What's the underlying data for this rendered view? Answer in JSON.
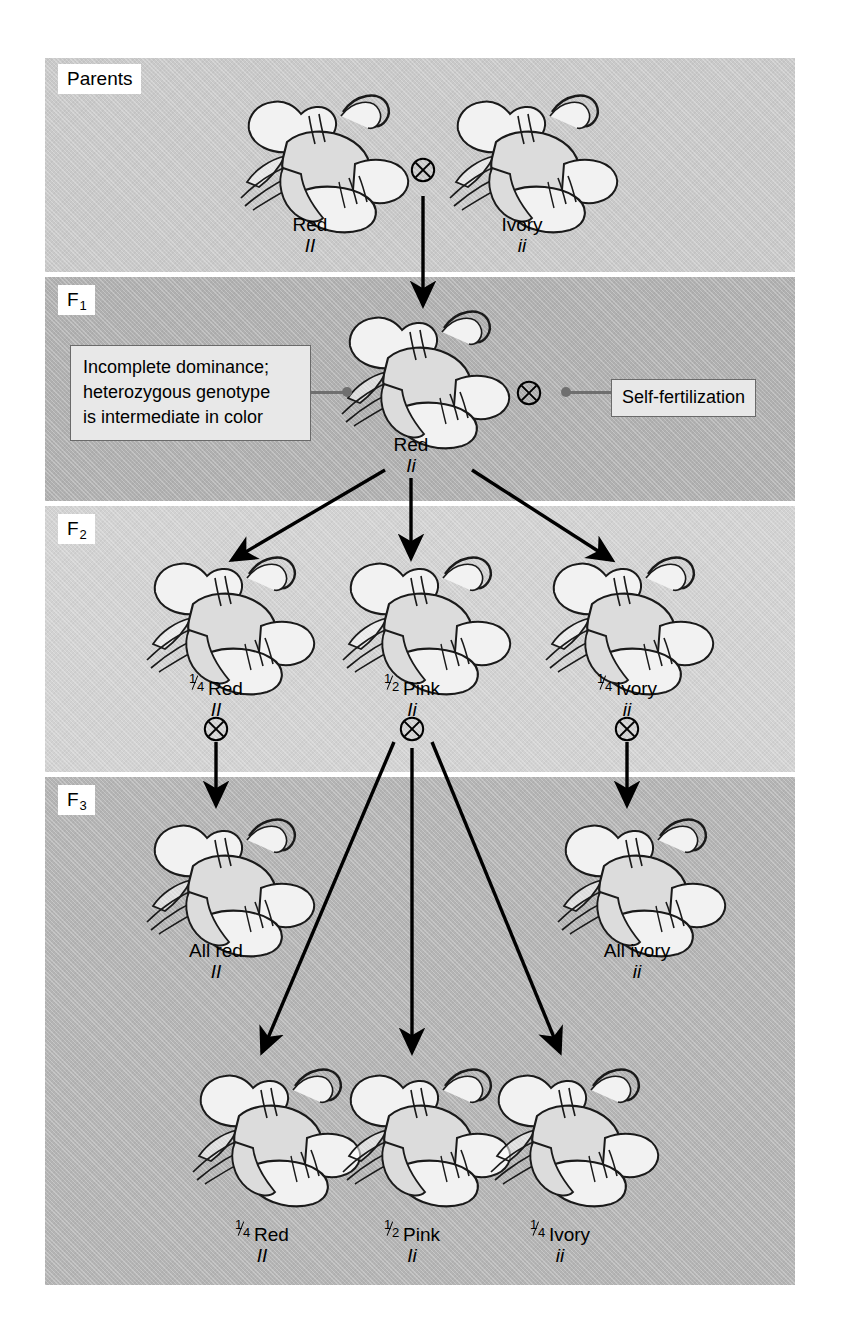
{
  "figure": {
    "background_color": "#ffffff"
  },
  "palette": {
    "band_parents": "#c9c9c9",
    "band_f1": "#b0b0b0",
    "band_f2": "#d2d2d2",
    "band_f3": "#b4b4b4",
    "flower_red": "#757575",
    "flower_pink": "#b3b3b3",
    "flower_ivory": "#f2f2f2",
    "outline": "#1a1a1a",
    "callout_fill": "#e8e8e8",
    "callout_border": "#6a6a6a",
    "leader_line": "#6f6f6f"
  },
  "generations": [
    {
      "id": "parents",
      "label": "Parents",
      "label_sub": ""
    },
    {
      "id": "f1",
      "label": "F",
      "label_sub": "1"
    },
    {
      "id": "f2",
      "label": "F",
      "label_sub": "2"
    },
    {
      "id": "f3",
      "label": "F",
      "label_sub": "3"
    }
  ],
  "parents": {
    "left": {
      "phenotype": "Red",
      "genotype": "II",
      "color": "red"
    },
    "right": {
      "phenotype": "Ivory",
      "genotype": "ii",
      "color": "ivory"
    },
    "cross_symbol": "circled-times"
  },
  "f1": {
    "offspring": {
      "phenotype": "Red",
      "genotype": "Ii",
      "color": "red"
    },
    "cross_symbol": "circled-times",
    "callout_left": "Incomplete dominance; heterozygous genotype is intermediate in color",
    "callout_left_lines": [
      "Incomplete dominance;",
      "heterozygous genotype",
      "is intermediate in color"
    ],
    "callout_right": "Self-fertilization"
  },
  "f2": {
    "offspring": [
      {
        "numerator": "1",
        "denominator": "4",
        "phenotype": "Red",
        "genotype": "II",
        "color": "red"
      },
      {
        "numerator": "1",
        "denominator": "2",
        "phenotype": "Pink",
        "genotype": "Ii",
        "color": "pink"
      },
      {
        "numerator": "1",
        "denominator": "4",
        "phenotype": "Ivory",
        "genotype": "ii",
        "color": "ivory"
      }
    ],
    "cross_symbol": "circled-times"
  },
  "f3": {
    "row_upper": [
      {
        "phenotype": "All red",
        "genotype": "II",
        "color": "red"
      },
      {
        "phenotype": "All ivory",
        "genotype": "ii",
        "color": "ivory"
      }
    ],
    "row_lower": [
      {
        "numerator": "1",
        "denominator": "4",
        "phenotype": "Red",
        "genotype": "II",
        "color": "red"
      },
      {
        "numerator": "1",
        "denominator": "2",
        "phenotype": "Pink",
        "genotype": "Ii",
        "color": "pink"
      },
      {
        "numerator": "1",
        "denominator": "4",
        "phenotype": "Ivory",
        "genotype": "ii",
        "color": "ivory"
      }
    ]
  }
}
